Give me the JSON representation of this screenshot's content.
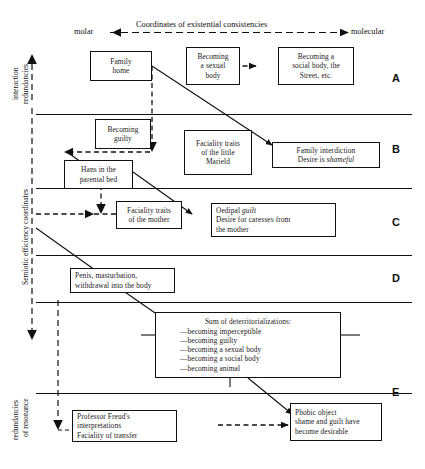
{
  "figure": {
    "title_faint": "",
    "top_axis_label": "Coordinates of existential consistencies",
    "axis_left_end": "molar",
    "axis_right_end": "molecular",
    "vertical_axis_label": "Semiotic efficiency coordinates",
    "vertical_top_label_line1": "interaction",
    "vertical_top_label_line2": "redundancies",
    "vertical_bottom_label_line1": "redundancies",
    "vertical_bottom_label_line2": "of resonance"
  },
  "rows": [
    {
      "letter": "A"
    },
    {
      "letter": "B"
    },
    {
      "letter": "C"
    },
    {
      "letter": "D"
    },
    {
      "letter": "E"
    }
  ],
  "boxes": {
    "family_home": {
      "line1": "Family",
      "line2": "home"
    },
    "becoming_sexual_body": {
      "line1": "Becoming",
      "line2": "a sexual",
      "line3": "body"
    },
    "becoming_social_body": {
      "line1": "Becoming a",
      "line2": "social body, the",
      "line3": "Street, etc."
    },
    "becoming_guilty": {
      "line1": "Becoming",
      "line2": "guilty"
    },
    "faciality_marield": {
      "line1": "Faciality traits",
      "line2": "of the little",
      "line3": "Marield"
    },
    "family_interdiction": {
      "line1": "Family interdiction",
      "line2a": "Desire is ",
      "line2b": "shameful"
    },
    "hans_parental_bed": {
      "line1": "Hans in the",
      "line2": "parental bed"
    },
    "faciality_mother": {
      "line1": "Faciality traits",
      "line2": "of the mother"
    },
    "oedipal_guilt": {
      "line1a": "Oedipal ",
      "line1b": "guilt",
      "line2": "Desire for caresses from",
      "line3": "the mother"
    },
    "penis_masturbation": {
      "line1": "Penis, masturbation,",
      "line2": "withdrawal into the body"
    },
    "sum_deterritorializations": {
      "title": "Sum of deterritorializations:",
      "items": [
        "—becoming imperceptible",
        "—becoming guilty",
        "—becoming a sexual body",
        "—becoming a social body",
        "—becoming animal"
      ]
    },
    "freud_interpretations": {
      "line1": "Professor Freud's",
      "line2": "interpretations",
      "line3": "Faciality of transfer"
    },
    "phobic_object": {
      "line1": "Phobic object",
      "line2": "shame and guilt have",
      "line3": "become desirable"
    }
  },
  "colors": {
    "ink": "#111111",
    "paper": "#ffffff"
  }
}
